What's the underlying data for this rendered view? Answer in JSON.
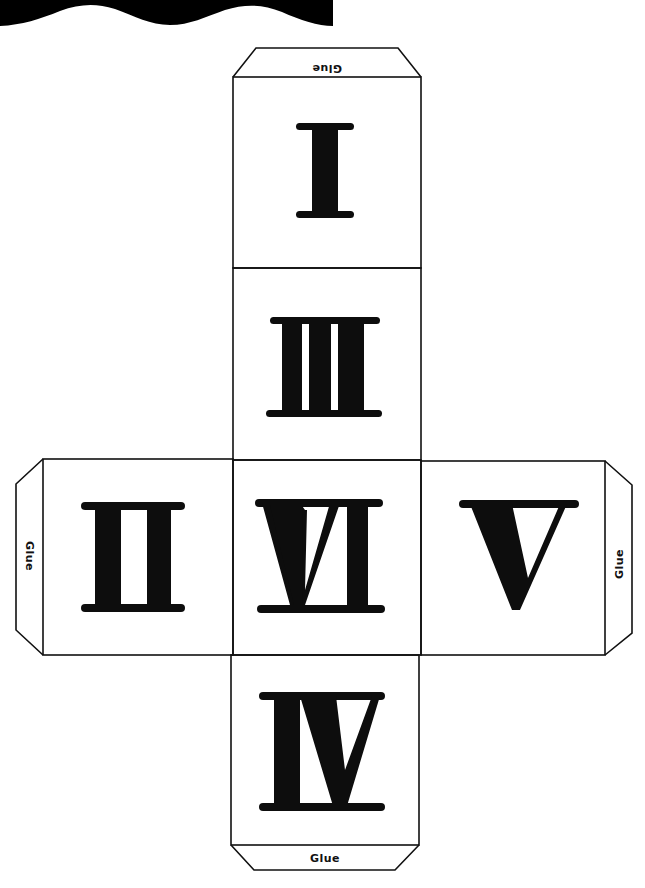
{
  "colors": {
    "ink": "#111111",
    "paper": "#ffffff",
    "band": "#000000"
  },
  "tabs": {
    "top": {
      "label": "Glue",
      "orientation": "upside-down"
    },
    "bottom": {
      "label": "Glue",
      "orientation": "upright"
    },
    "left": {
      "label": "Glue",
      "orientation": "rotated-90-cw"
    },
    "right": {
      "label": "Glue",
      "orientation": "rotated-90-ccw"
    }
  },
  "faces": [
    {
      "id": "top",
      "numeral": "I",
      "value": 1
    },
    {
      "id": "upper-middle",
      "numeral": "III",
      "value": 3
    },
    {
      "id": "left",
      "numeral": "II",
      "value": 2
    },
    {
      "id": "center",
      "numeral": "VI",
      "value": 6
    },
    {
      "id": "right",
      "numeral": "V",
      "value": 5
    },
    {
      "id": "bottom",
      "numeral": "IV",
      "value": 4
    }
  ]
}
